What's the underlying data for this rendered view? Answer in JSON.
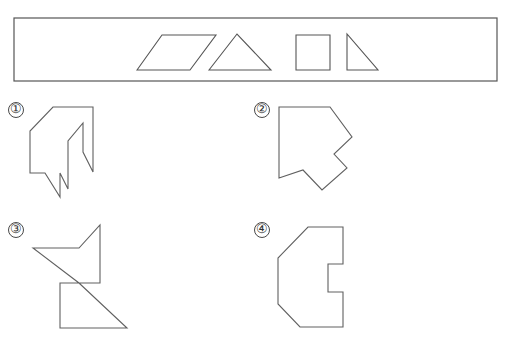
{
  "page": {
    "background_color": "#ffffff",
    "stroke_color": "#555555",
    "width": 512,
    "height": 350
  },
  "piece_bank": {
    "name": "piece-bank",
    "border_color": "#555555",
    "x": 14,
    "y": 18,
    "width": 483,
    "height": 63,
    "pieces": [
      {
        "name": "parallelogram",
        "label": "parallelogram",
        "points": "137,70 162,35 216,35 190,70"
      },
      {
        "name": "triangle-isosceles",
        "label": "isosceles triangle",
        "points": "209,70 237,34 271,70"
      },
      {
        "name": "square",
        "label": "square",
        "points": "296,35 330,35 330,70 296,70"
      },
      {
        "name": "triangle-right",
        "label": "right triangle",
        "points": "347,34 347,70 378,70"
      }
    ]
  },
  "candidates": [
    {
      "name": "candidate-1",
      "label": "①",
      "label_x": 16,
      "label_y": 110,
      "points": "53,107 93,107 93,172 83,152 83,123 68,141 68,189 60,173 60,197 45,173 30,173 30,131"
    },
    {
      "name": "candidate-2",
      "label": "②",
      "label_x": 262,
      "label_y": 110,
      "points": "279,107 330,107 352,137 334,154 347,168 322,190 303,170 279,178"
    },
    {
      "name": "candidate-3",
      "label": "③",
      "label_x": 16,
      "label_y": 230,
      "points": "100,225 100,283 60,283 60,328 127,328 79,283 33,248 79,248"
    },
    {
      "name": "candidate-4",
      "label": "④",
      "label_x": 262,
      "label_y": 230,
      "points": "308,227 343,227 343,264 328,264 328,292 343,292 343,327 300,327 278,304 278,258"
    }
  ]
}
